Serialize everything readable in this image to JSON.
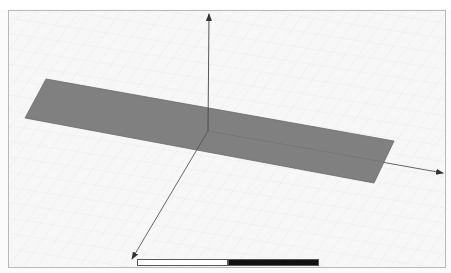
{
  "window": {
    "type": "3d-modeler-viewport"
  },
  "viewport": {
    "background_color": "#f7f7f7",
    "grid_color": "#e6e6e6",
    "border_color": "#b9b9b9"
  },
  "model": {
    "shape": "rectangular-plate",
    "fill_color": "#808080",
    "edge_color": "#6a6a6a"
  },
  "axes": {
    "color": "#555555",
    "x_axis_direction": "right",
    "y_axis_direction": "front-left",
    "z_axis_direction": "up"
  },
  "scale_bar": {
    "segments": [
      "white",
      "black"
    ],
    "labels": [
      "",
      "",
      ""
    ]
  }
}
